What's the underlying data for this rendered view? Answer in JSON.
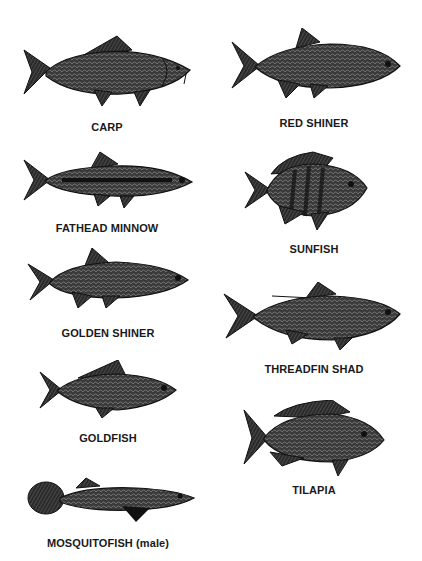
{
  "colors": {
    "ink": "#1a1a1a",
    "body": "#3a3a3a",
    "scale": "#6a6a6a",
    "background": "#ffffff"
  },
  "left_column": [
    {
      "name": "CARP"
    },
    {
      "name": "FATHEAD MINNOW"
    },
    {
      "name": "GOLDEN SHINER"
    },
    {
      "name": "GOLDFISH"
    },
    {
      "name": "MOSQUITOFISH (male)"
    }
  ],
  "right_column": [
    {
      "name": "RED SHINER"
    },
    {
      "name": "SUNFISH"
    },
    {
      "name": "THREADFIN SHAD"
    },
    {
      "name": "TILAPIA"
    }
  ]
}
